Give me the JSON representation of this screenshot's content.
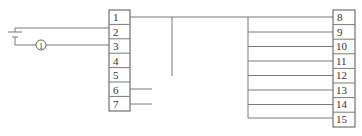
{
  "diagram": {
    "type": "terminal-wiring-diagram",
    "left_terminal_block": {
      "labels": [
        "1",
        "2",
        "3",
        "4",
        "5",
        "6",
        "7"
      ]
    },
    "right_terminal_block": {
      "labels": [
        "8",
        "9",
        "10",
        "11",
        "12",
        "13",
        "14",
        "15"
      ]
    },
    "source": {
      "symbol": "battery-icon",
      "connects_to_terminal": "2"
    },
    "meter": {
      "label": "1",
      "symbol": "circled-number",
      "connects_to_terminal": "3"
    },
    "connections": [
      {
        "from": "1",
        "to": "8"
      },
      {
        "from": "1",
        "to": "bus-vertical"
      },
      {
        "from": "bus",
        "to": [
          "9",
          "10",
          "11",
          "12",
          "13",
          "14",
          "15"
        ]
      },
      {
        "from": "6",
        "to": "stub"
      },
      {
        "from": "7",
        "to": "stub"
      }
    ],
    "colors": {
      "line": "#7a7a7a",
      "box_border": "#555555",
      "text": "#333333",
      "background": "#ffffff"
    }
  }
}
